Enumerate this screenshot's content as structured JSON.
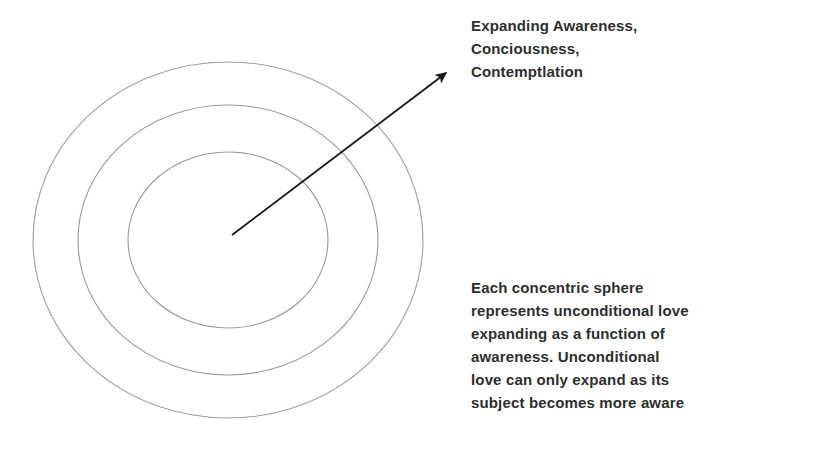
{
  "page": {
    "background_color": "#ffffff",
    "width": 836,
    "height": 460
  },
  "diagram": {
    "type": "concentric-circles-with-arrow",
    "stroke_color": "#9a9a9a",
    "arrow_color": "#1a1a1a",
    "center": {
      "x": 228,
      "y": 240
    },
    "circles": [
      {
        "name": "inner-sphere",
        "rx": 100,
        "ry": 88
      },
      {
        "name": "middle-sphere",
        "rx": 150,
        "ry": 135
      },
      {
        "name": "outer-sphere",
        "rx": 195,
        "ry": 178
      }
    ],
    "arrow": {
      "from": {
        "x": 232,
        "y": 235
      },
      "to": {
        "x": 452,
        "y": 68
      }
    }
  },
  "annotations": {
    "expanding_awareness": {
      "text": "Expanding Awareness,\nConciousness,\nContemptlation",
      "lines": [
        "Expanding Awareness,",
        "Conciousness,",
        "Contemptlation"
      ]
    },
    "description": {
      "text": "Each concentric sphere\nrepresents unconditional love\nexpanding as a function of\nawareness. Unconditional\nlove can only expand as its\nsubject becomes more aware",
      "lines": [
        "Each concentric sphere",
        "represents unconditional love",
        "expanding as a function of",
        "awareness. Unconditional",
        "love can only expand as its",
        "subject becomes more aware"
      ]
    }
  }
}
